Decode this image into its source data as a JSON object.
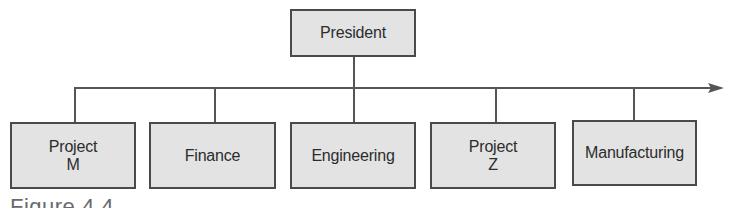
{
  "diagram": {
    "type": "organization-chart",
    "top": {
      "label": "President"
    },
    "children": [
      {
        "label": "Project\nM"
      },
      {
        "label": "Finance"
      },
      {
        "label": "Engineering"
      },
      {
        "label": "Project\nZ"
      },
      {
        "label": "Manufacturing"
      }
    ],
    "connector": {
      "style": "horizontal bus with arrow extending right",
      "arrow": "right-arrow"
    },
    "caption": "Figure 4.4"
  },
  "colors": {
    "box_fill": "#e3e3e3",
    "box_border": "#4a4a4a",
    "line": "#555555",
    "text": "#2c2c2c"
  }
}
